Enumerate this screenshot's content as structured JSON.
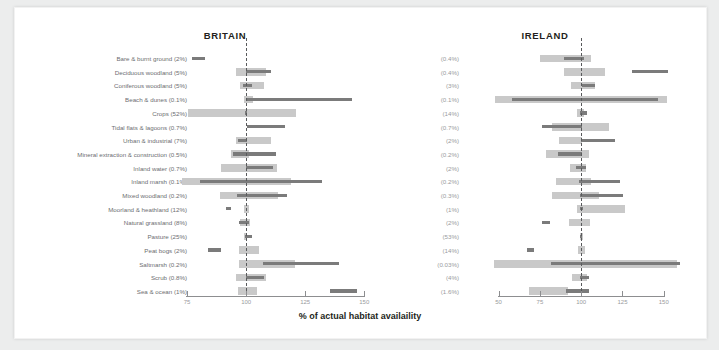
{
  "figure": {
    "xaxis_title": "% of actual habitat availaility",
    "panels": [
      {
        "key": "britain",
        "title": "BRITAIN"
      },
      {
        "key": "ireland",
        "title": "IRELAND"
      }
    ]
  },
  "chart_data": {
    "type": "bar",
    "title": "",
    "xlabel": "% of actual habitat availaility",
    "ylabel": "",
    "grid": false,
    "legend": "none",
    "reference_line": 100,
    "categories": [
      "Bare & burnt ground",
      "Deciduous woodland",
      "Coniferous woodland",
      "Beach & dunes",
      "Crops",
      "Tidal flats & lagoons",
      "Urban & industrial",
      "Mineral extraction & construction",
      "Inland water",
      "Inland marsh",
      "Mixed woodland",
      "Moorland & heathland",
      "Natural grassland",
      "Pasture",
      "Peat bogs",
      "Saltmarsh",
      "Scrub",
      "Sea & ocean"
    ],
    "panels": [
      {
        "name": "BRITAIN",
        "xlim": [
          72,
          152
        ],
        "xticks": [
          75,
          100,
          125,
          150
        ],
        "availability_pct": [
          "2%",
          "5%",
          "5%",
          "0.1%",
          "52%",
          "0.7%",
          "7%",
          "0.5%",
          "0.7%",
          "0.1%",
          "0.2%",
          "12%",
          "8%",
          "25%",
          "2%",
          "0.2%",
          "0.8%",
          "1%"
        ],
        "series": [
          {
            "name": "range-band",
            "type": "band",
            "values": [
              null,
              [
                95.5,
                108.5
              ],
              [
                97.5,
                107.5
              ],
              [
                99.0,
                103.0
              ],
              [
                75.5,
                121.0
              ],
              null,
              [
                95.5,
                110.5
              ],
              [
                93.5,
                101.0
              ],
              [
                89.5,
                113.0
              ],
              [
                73.0,
                119.0
              ],
              [
                89.0,
                113.5
              ],
              [
                99.0,
                101.0
              ],
              [
                97.5,
                101.5
              ],
              [
                99.0,
                100.5
              ],
              [
                97.0,
                105.5
              ],
              [
                97.0,
                120.5
              ],
              [
                95.5,
                108.5
              ],
              [
                96.5,
                104.5
              ]
            ]
          },
          {
            "name": "median-bar",
            "type": "bar",
            "values": [
              [
                77.0,
                82.5
              ],
              [
                100.0,
                110.5
              ],
              [
                98.5,
                102.5
              ],
              [
                100.0,
                145.0
              ],
              [
                99.5,
                100.5
              ],
              [
                100.5,
                116.5
              ],
              [
                96.5,
                100.5
              ],
              [
                94.5,
                112.5
              ],
              [
                100.0,
                111.5
              ],
              [
                80.5,
                132.0
              ],
              [
                96.0,
                117.5
              ],
              [
                91.5,
                93.5
              ],
              [
                97.0,
                101.0
              ],
              [
                99.5,
                102.5
              ],
              [
                84.0,
                89.5
              ],
              [
                107.0,
                139.5
              ],
              [
                100.0,
                107.5
              ],
              [
                135.5,
                147.0
              ]
            ]
          }
        ]
      },
      {
        "name": "IRELAND",
        "xlim": [
          46,
          158
        ],
        "xticks": [
          50,
          75,
          100,
          125,
          150
        ],
        "availability_pct": [
          "0.4%",
          "0.4%",
          "3%",
          "0.1%",
          "14%",
          "0.7%",
          "2%",
          "0.2%",
          "2%",
          "0.2%",
          "0.3%",
          "1%",
          "2%",
          "53%",
          "14%",
          "0.03%",
          "4%",
          "1.6%"
        ],
        "series": [
          {
            "name": "range-band",
            "type": "band",
            "values": [
              [
                75.0,
                106.0
              ],
              [
                89.5,
                114.5
              ],
              [
                94.0,
                108.5
              ],
              [
                48.0,
                152.0
              ],
              [
                97.5,
                101.5
              ],
              [
                82.5,
                117.0
              ],
              [
                86.5,
                100.5
              ],
              [
                78.5,
                105.0
              ],
              [
                93.0,
                103.0
              ],
              [
                84.5,
                106.0
              ],
              [
                82.5,
                110.5
              ],
              [
                97.5,
                126.5
              ],
              [
                92.5,
                105.5
              ],
              [
                99.0,
                101.0
              ],
              [
                98.0,
                102.5
              ],
              [
                47.0,
                158.0
              ],
              [
                94.5,
                103.5
              ],
              [
                68.5,
                92.0
              ]
            ]
          },
          {
            "name": "median-bar",
            "type": "bar",
            "values": [
              [
                89.5,
                101.5
              ],
              [
                130.5,
                152.5
              ],
              [
                100.5,
                108.5
              ],
              [
                58.0,
                146.5
              ],
              [
                99.5,
                103.5
              ],
              [
                76.5,
                100.5
              ],
              [
                100.0,
                120.5
              ],
              [
                86.0,
                100.5
              ],
              [
                97.0,
                103.0
              ],
              [
                98.5,
                123.5
              ],
              [
                99.0,
                125.5
              ],
              [
                99.0,
                101.0
              ],
              [
                76.5,
                81.0
              ],
              [
                99.5,
                100.5
              ],
              [
                67.0,
                71.5
              ],
              [
                81.5,
                160.0
              ],
              [
                99.5,
                104.5
              ],
              [
                90.5,
                105.0
              ]
            ]
          }
        ]
      }
    ]
  }
}
